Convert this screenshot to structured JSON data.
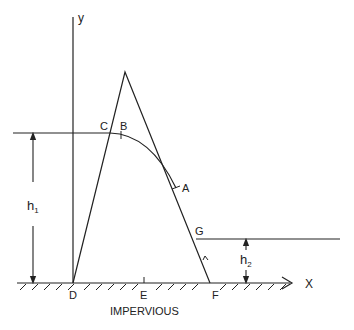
{
  "diagram": {
    "type": "seepage-through-earth-dam",
    "axes": {
      "y_label": "y",
      "x_label": "X"
    },
    "points": {
      "A": "A",
      "B": "B",
      "C": "C",
      "D": "D",
      "E": "E",
      "F": "F",
      "G": "G"
    },
    "dimensions": {
      "upstream_head": "h",
      "upstream_sub": "1",
      "downstream_head": "h",
      "downstream_sub": "2"
    },
    "base_label": "IMPERVIOUS",
    "colors": {
      "ink": "#222222",
      "background": "#ffffff"
    }
  }
}
